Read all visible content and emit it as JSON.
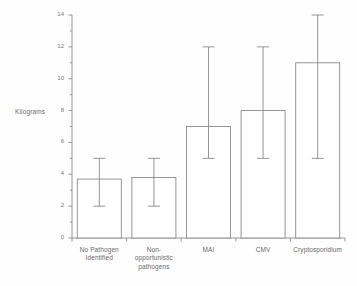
{
  "chart_data": {
    "type": "bar",
    "title": "",
    "xlabel": "",
    "ylabel": "Kilograms",
    "ylim": [
      0,
      14
    ],
    "y_ticks": [
      0,
      2,
      4,
      6,
      8,
      10,
      12,
      14
    ],
    "y_tick_labels": [
      "0",
      "2",
      "4",
      "6",
      "8",
      "10",
      "12",
      "14"
    ],
    "y_minor_ticks": [
      1,
      3,
      5,
      7,
      9,
      11,
      13
    ],
    "grid": false,
    "legend": null,
    "categories": [
      "No Pathogen\nIdentified",
      "Non-\nopportunistic\npathogens",
      "MAI",
      "CMV",
      "Cryptosporidium"
    ],
    "values": [
      3.7,
      3.8,
      7.0,
      8.0,
      11.0
    ],
    "error_low": [
      2.0,
      2.0,
      5.0,
      5.0,
      5.0
    ],
    "error_high": [
      5.0,
      5.0,
      12.0,
      12.0,
      14.0
    ],
    "bar_fill": "#ffffff",
    "bar_stroke": "#8a8a8a",
    "error_stroke": "#8a8a8a",
    "axis_stroke": "#8a8a8a",
    "text_color": "#6a6a6a",
    "background": "#fefefe"
  }
}
